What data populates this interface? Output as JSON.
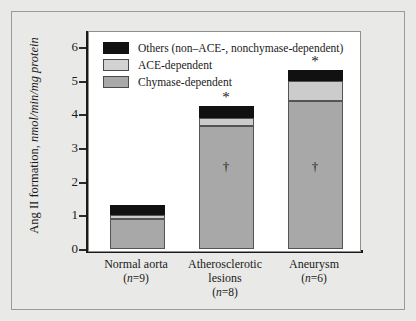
{
  "figure": {
    "background_color": "#e9e9e7",
    "panel_background": "#ffffff"
  },
  "legend": {
    "position": "top-left-inside",
    "items": [
      {
        "key": "others",
        "label": "Others (non–ACE-, nonchymase-dependent)",
        "color": "#111111"
      },
      {
        "key": "ace",
        "label": "ACE-dependent",
        "color": "#d2d2d2"
      },
      {
        "key": "chymase",
        "label": "Chymase-dependent",
        "color": "#a9a9a9"
      }
    ]
  },
  "yaxis": {
    "title_plain": "Ang II formation, ",
    "title_italic": "nmol/min/mg protein",
    "ticks": [
      "0",
      "1",
      "2",
      "3",
      "4",
      "5",
      "6"
    ]
  },
  "annotations": {
    "star": "*",
    "dagger": "†"
  },
  "chart_data": {
    "type": "bar",
    "title": "",
    "xlabel": "",
    "ylabel": "Ang II formation, nmol/min/mg protein",
    "ylim": [
      0,
      6.5
    ],
    "yticks": [
      0,
      1,
      2,
      3,
      4,
      5,
      6
    ],
    "grid": false,
    "stacked": true,
    "legend_position": "upper left",
    "categories": [
      "Normal aorta",
      "Atherosclerotic lesions",
      "Aneurysm"
    ],
    "category_counts": [
      "(n=9)",
      "(n=8)",
      "(n=6)"
    ],
    "series": [
      {
        "name": "Chymase-dependent",
        "color": "#a8a8a8",
        "values": [
          0.9,
          3.65,
          4.4
        ]
      },
      {
        "name": "ACE-dependent",
        "color": "#cccccc",
        "values": [
          0.1,
          0.25,
          0.6
        ]
      },
      {
        "name": "Others (non–ACE-, nonchymase-dependent)",
        "color": "#111111",
        "values": [
          0.3,
          0.35,
          0.3
        ]
      }
    ],
    "totals": [
      1.3,
      4.25,
      5.3
    ],
    "point_annotations": [
      {
        "category": "Atherosclerotic lesions",
        "symbol": "*",
        "placement": "above-bar",
        "y": 4.55
      },
      {
        "category": "Aneurysm",
        "symbol": "*",
        "placement": "above-bar",
        "y": 5.62
      },
      {
        "category": "Atherosclerotic lesions",
        "symbol": "†",
        "placement": "inside-bar",
        "y": 2.5
      },
      {
        "category": "Aneurysm",
        "symbol": "†",
        "placement": "inside-bar",
        "y": 2.5
      }
    ]
  }
}
